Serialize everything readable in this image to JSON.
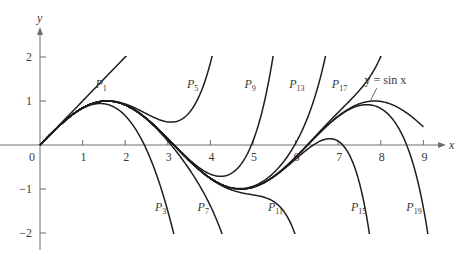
{
  "chart_data": {
    "type": "line",
    "title": "",
    "xlabel": "x",
    "ylabel": "y",
    "xlim": [
      0,
      9.4
    ],
    "ylim": [
      -2,
      2
    ],
    "grid": false,
    "legend": null,
    "x_ticks": [
      0,
      1,
      2,
      3,
      4,
      5,
      6,
      7,
      8,
      9
    ],
    "x_tick_labels": [
      "0",
      "1",
      "2",
      "3",
      "4",
      "5",
      "6",
      "7",
      "8",
      "9"
    ],
    "y_ticks": [
      2,
      1,
      -1,
      -2
    ],
    "y_tick_labels": [
      "2",
      "1",
      "−1",
      "−2"
    ],
    "function": "sin x",
    "series": [
      {
        "name": "P1",
        "degree": 1,
        "label_main": "P",
        "label_sub": "1",
        "label_pos": [
          1.3,
          1.3
        ]
      },
      {
        "name": "P3",
        "degree": 3,
        "label_main": "P",
        "label_sub": "3",
        "label_pos": [
          2.7,
          -1.5
        ]
      },
      {
        "name": "P5",
        "degree": 5,
        "label_main": "P",
        "label_sub": "5",
        "label_pos": [
          3.45,
          1.3
        ]
      },
      {
        "name": "P7",
        "degree": 7,
        "label_main": "P",
        "label_sub": "7",
        "label_pos": [
          3.7,
          -1.5
        ]
      },
      {
        "name": "P9",
        "degree": 9,
        "label_main": "P",
        "label_sub": "9",
        "label_pos": [
          4.8,
          1.3
        ]
      },
      {
        "name": "P11",
        "degree": 11,
        "label_main": "P",
        "label_sub": "11",
        "label_pos": [
          5.35,
          -1.5
        ]
      },
      {
        "name": "P13",
        "degree": 13,
        "label_main": "P",
        "label_sub": "13",
        "label_pos": [
          5.85,
          1.3
        ]
      },
      {
        "name": "P15",
        "degree": 15,
        "label_main": "P",
        "label_sub": "15",
        "label_pos": [
          7.3,
          -1.5
        ]
      },
      {
        "name": "P17",
        "degree": 17,
        "label_main": "P",
        "label_sub": "17",
        "label_pos": [
          6.85,
          1.3
        ]
      },
      {
        "name": "P19",
        "degree": 19,
        "label_main": "P",
        "label_sub": "19",
        "label_pos": [
          8.6,
          -1.5
        ]
      },
      {
        "name": "y = sin x",
        "degree": null,
        "label_main": "y = sin x",
        "label_sub": "",
        "label_pos": [
          7.9,
          1.2
        ],
        "x_range": [
          0,
          9
        ]
      }
    ],
    "annotation": {
      "text": "y = sin x",
      "points_to": [
        7.95,
        0.97
      ]
    }
  },
  "axes": {
    "x_label": "x",
    "y_label": "y",
    "origin_label": "0"
  }
}
